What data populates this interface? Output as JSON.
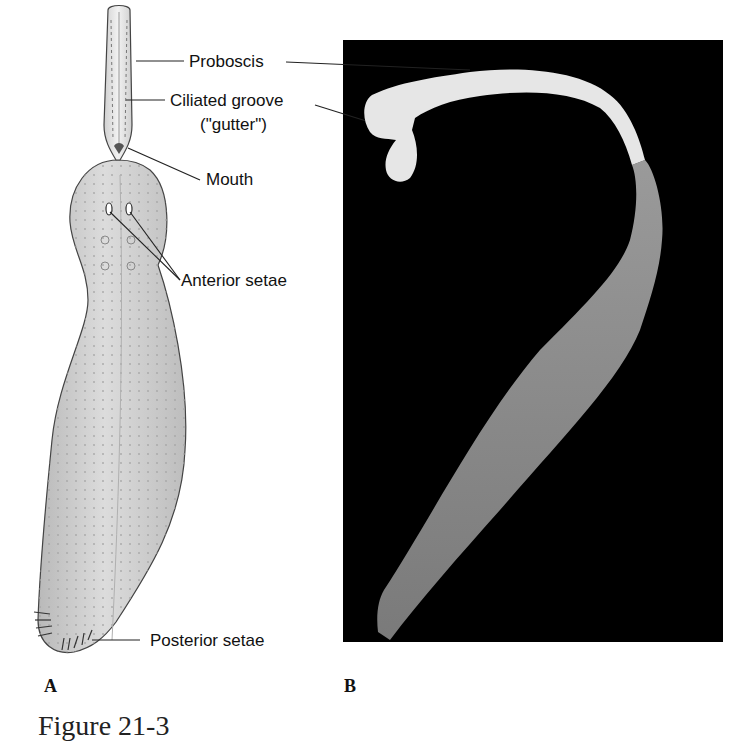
{
  "figure": {
    "caption": "Figure 21-3",
    "panels": [
      {
        "id": "A",
        "letter": "A",
        "kind": "illustration"
      },
      {
        "id": "B",
        "letter": "B",
        "kind": "photograph"
      }
    ]
  },
  "labels": {
    "proboscis": "Proboscis",
    "ciliated_groove_line1": "Ciliated groove",
    "ciliated_groove_line2": "(\"gutter\")",
    "mouth": "Mouth",
    "anterior_setae": "Anterior setae",
    "posterior_setae": "Posterior setae"
  },
  "colors": {
    "photo_background": "#000000",
    "body_fill": "#c8c8c8",
    "proboscis_fill": "#e6e6e6",
    "photo_specimen_light": "#e8e8e8",
    "photo_specimen_body": "#8a8a8a",
    "leader_lines": "#222222"
  }
}
